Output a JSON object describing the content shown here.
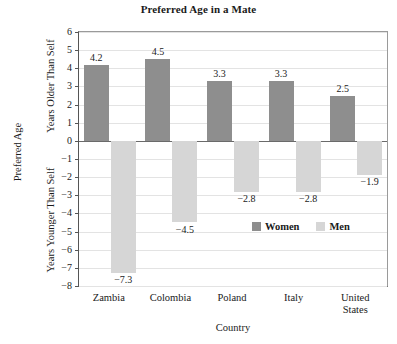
{
  "chart_data": {
    "type": "bar",
    "title": "Preferred Age in a Mate",
    "xlabel": "Country",
    "ylabel": "Preferred Age",
    "ylabel_upper": "Years Older Than Self",
    "ylabel_lower": "Years Younger Than Self",
    "categories": [
      "Zambia",
      "Colombia",
      "Poland",
      "Italy",
      "United\nStates"
    ],
    "series": [
      {
        "name": "Women",
        "color": "#8e8e8e",
        "values": [
          4.2,
          4.5,
          3.3,
          3.3,
          2.5
        ],
        "labels": [
          "4.2",
          "4.5",
          "3.3",
          "3.3",
          "2.5"
        ]
      },
      {
        "name": "Men",
        "color": "#d6d6d6",
        "values": [
          -7.3,
          -4.5,
          -2.8,
          -2.8,
          -1.9
        ],
        "labels": [
          "−7.3",
          "−4.5",
          "−2.8",
          "−2.8",
          "−1.9"
        ]
      }
    ],
    "ylim": [
      -8,
      6
    ],
    "yticks": [
      6,
      5,
      4,
      3,
      2,
      1,
      0,
      -1,
      -2,
      -3,
      -4,
      -5,
      -6,
      -7,
      -8
    ],
    "ytick_labels": [
      "6",
      "5",
      "4",
      "3",
      "2",
      "1",
      "0",
      "−1",
      "−2",
      "−3",
      "−4",
      "−5",
      "−6",
      "−7",
      "−8"
    ],
    "grid": true,
    "legend_position": "inside-bottom-right"
  }
}
